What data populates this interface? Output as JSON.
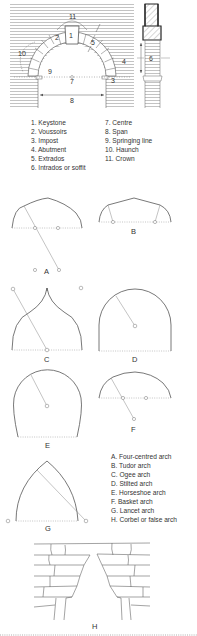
{
  "diagram": {
    "main_arch": {
      "labels": {
        "l1": "1",
        "l2": "2",
        "l3": "3",
        "l4": "4",
        "l5": "5",
        "l6": "6",
        "l7": "7",
        "l8": "8",
        "l9": "9",
        "l10": "10",
        "l11": "11"
      }
    },
    "parts_legend": {
      "col1": [
        "1. Keystone",
        "2. Voussoirs",
        "3. Impost",
        "4. Abutment",
        "5. Extrados",
        "6. Intrados or soffit"
      ],
      "col2": [
        "7. Centre",
        "8. Span",
        "9. Springing line",
        "10. Haunch",
        "11. Crown"
      ]
    },
    "arch_types": {
      "A": "A",
      "B": "B",
      "C": "C",
      "D": "D",
      "E": "E",
      "F": "F",
      "G": "G",
      "H": "H"
    },
    "types_legend": [
      "A. Four-centred arch",
      "B. Tudor arch",
      "C. Ogee arch",
      "D. Stilted arch",
      "E. Horseshoe arch",
      "F. Basket arch",
      "G. Lancet arch",
      "H. Corbel or false arch"
    ],
    "colors": {
      "line": "#555555",
      "text": "#333333",
      "hatch": "#9a9a9a"
    }
  }
}
